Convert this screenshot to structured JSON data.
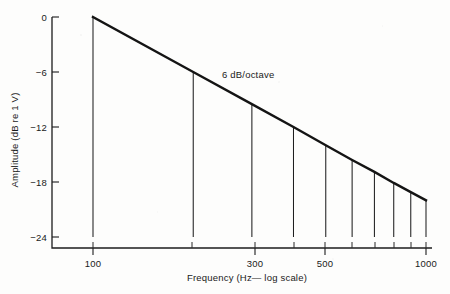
{
  "chart_data": {
    "type": "line",
    "title": "",
    "xlabel": "Frequency (Hz— log scale)",
    "ylabel": "Amplitude (dB re 1 V)",
    "xscale": "log",
    "xlim": [
      100,
      1000
    ],
    "ylim": [
      -24,
      0
    ],
    "grid": false,
    "legend": null,
    "x": [
      100,
      200,
      300,
      400,
      500,
      600,
      700,
      800,
      900,
      1000
    ],
    "values": [
      0,
      -6.0,
      -9.5,
      -12.0,
      -14.0,
      -15.6,
      -16.9,
      -18.1,
      -19.1,
      -20.0
    ],
    "series": [
      {
        "name": "6 dB/octave roll-off",
        "x": [
          100,
          200,
          300,
          400,
          500,
          600,
          700,
          800,
          900,
          1000
        ],
        "values": [
          0,
          -6.0,
          -9.5,
          -12.0,
          -14.0,
          -15.6,
          -16.9,
          -18.1,
          -19.1,
          -20.0
        ]
      }
    ],
    "drop_lines": {
      "description": "vertical lines from the curve down to the -24 dB baseline",
      "x": [
        100,
        200,
        300,
        400,
        500,
        600,
        700,
        800,
        900,
        1000
      ],
      "baseline": -24
    },
    "annotations": [
      {
        "text": "6 dB/octave",
        "x": 370,
        "y": -5.0
      }
    ],
    "xticks_major": [
      100,
      300,
      500,
      1000
    ],
    "xticklabels": [
      "100",
      "300",
      "500",
      "1000"
    ],
    "xticks_minor": [
      200,
      400,
      600,
      700,
      800,
      900
    ],
    "yticks": [
      0,
      -6,
      -12,
      -18,
      -24
    ],
    "yticklabels": [
      "0",
      "−6",
      "−12",
      "−18",
      "−24"
    ]
  },
  "axes": {
    "y_axis_title": "Amplitude (dB re 1 V)",
    "x_axis_title": "Frequency (Hz— log scale)"
  },
  "annotation": {
    "slope_label": "6 dB/octave"
  },
  "colors": {
    "ink": "#141414",
    "paper": "#fdfdfc"
  }
}
